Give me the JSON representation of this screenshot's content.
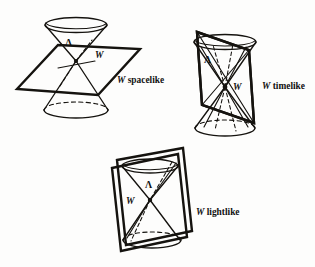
{
  "figure": {
    "background_color": "#fdfdfc",
    "ink_color": "#15130f",
    "panels": [
      {
        "id": "spacelike",
        "cone_label": "Λ",
        "plane_label": "W",
        "caption_symbol": "W",
        "caption_kind": " spacelike",
        "caption_full": "W spacelike",
        "description": "Double light cone cut by a nearly horizontal plane through the vertex"
      },
      {
        "id": "timelike",
        "cone_label": "Λ",
        "plane_label": "W",
        "caption_symbol": "W",
        "caption_kind": " timelike",
        "caption_full": "W timelike",
        "description": "Double light cone cut by a vertical plane through the vertex"
      },
      {
        "id": "lightlike",
        "cone_label": "Λ",
        "plane_label": "W",
        "caption_symbol": "W",
        "caption_kind": " lightlike",
        "caption_full": "W lightlike",
        "description": "Double light cone cut by a tilted plane tangent to the cone along a ruling"
      }
    ]
  }
}
